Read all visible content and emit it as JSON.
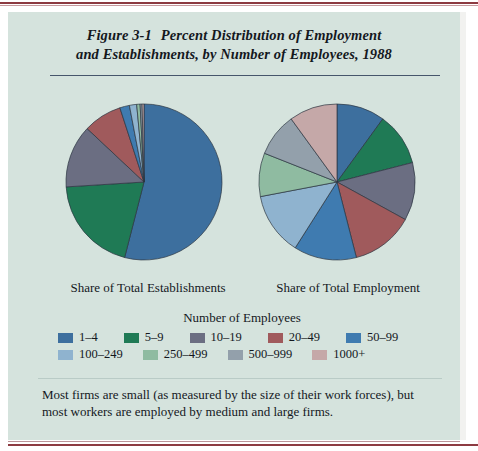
{
  "figure": {
    "number": "Figure 3-1",
    "title_line1": "Percent Distribution of Employment",
    "title_line2": "and Establishments, by Number of Employees, 1988",
    "note": "Most firms are small (as measured by the size of their work forces), but most workers are employed by medium and large firms.",
    "panel_color": "#d5e3dd",
    "rule_color": "#8d3b42",
    "divider_color": "#46566b"
  },
  "legend": {
    "title": "Number of Employees",
    "row1": [
      {
        "label": "1–4",
        "color": "#3d6f9e"
      },
      {
        "label": "5–9",
        "color": "#1f7a55"
      },
      {
        "label": "10–19",
        "color": "#6b6e82"
      },
      {
        "label": "20–49",
        "color": "#a05a5c"
      },
      {
        "label": "50–99",
        "color": "#3f7bb0"
      }
    ],
    "row2": [
      {
        "label": "100–249",
        "color": "#8fb3cf"
      },
      {
        "label": "250–499",
        "color": "#8fbba1"
      },
      {
        "label": "500–999",
        "color": "#93a0ab"
      },
      {
        "label": "1000+",
        "color": "#c5a8a8"
      }
    ]
  },
  "chart_data": {
    "type": "pie",
    "categories": [
      "1–4",
      "5–9",
      "10–19",
      "20–49",
      "50–99",
      "100–249",
      "250–499",
      "500–999",
      "1000+"
    ],
    "colors": [
      "#3d6f9e",
      "#1f7a55",
      "#6b6e82",
      "#a05a5c",
      "#3f7bb0",
      "#8fb3cf",
      "#8fbba1",
      "#93a0ab",
      "#c5a8a8"
    ],
    "legend_title": "Number of Employees",
    "legend_position": "bottom",
    "charts": [
      {
        "name": "Share of Total Establishments",
        "caption": "Share of Total Establishments",
        "center": [
          140,
          176
        ],
        "radius": 78,
        "start_angle": 0,
        "values": [
          54.0,
          20.0,
          13.0,
          8.0,
          2.0,
          1.5,
          0.7,
          0.4,
          0.4
        ]
      },
      {
        "name": "Share of Total Employment",
        "caption": "Share of Total Employment",
        "center": [
          333,
          176
        ],
        "radius": 78,
        "start_angle": 0,
        "values": [
          10.0,
          11.0,
          12.0,
          13.0,
          13.0,
          13.0,
          9.0,
          9.0,
          10.0
        ]
      }
    ]
  }
}
